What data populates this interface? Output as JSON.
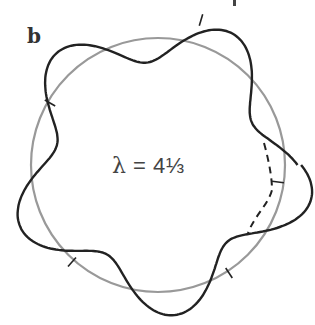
{
  "figure": {
    "panel_label": "b",
    "equation": {
      "symbol": "λ",
      "operator": "=",
      "value": "4⅓"
    },
    "elements": {
      "reference_circle": {
        "color": "#999999",
        "shape": "circle"
      },
      "wave_curve": {
        "color": "#222222",
        "lobes": 5,
        "style": "solid"
      },
      "continuation_arc": {
        "color": "#222222",
        "style": "dashed"
      },
      "crossing_ticks": {
        "count": 6
      }
    },
    "colors": {
      "circle": "#999999",
      "wave": "#222222",
      "text": "#444444"
    }
  }
}
